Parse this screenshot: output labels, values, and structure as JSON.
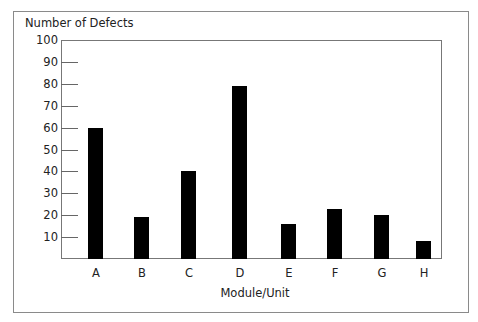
{
  "chart_data": {
    "type": "bar",
    "title": "",
    "ylabel": "Number of Defects",
    "xlabel": "Module/Unit",
    "categories": [
      "A",
      "B",
      "C",
      "D",
      "E",
      "F",
      "G",
      "H"
    ],
    "values": [
      60,
      19,
      40,
      79,
      16,
      23,
      20,
      8
    ],
    "ylim": [
      0,
      100
    ],
    "yticks": [
      10,
      20,
      30,
      40,
      50,
      60,
      70,
      80,
      90,
      100
    ],
    "grid": false,
    "legend": null,
    "bar_color": "#000000"
  },
  "labels": {
    "y_title": "Number of Defects",
    "x_title": "Module/Unit"
  }
}
